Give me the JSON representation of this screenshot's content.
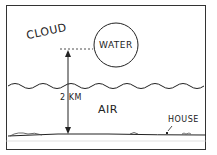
{
  "labels": {
    "cloud": "CLOUD",
    "water": "WATER",
    "distance": "2 KM",
    "air": "AIR",
    "house": "HOUSE"
  }
}
